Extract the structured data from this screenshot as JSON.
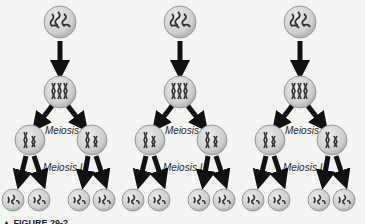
{
  "diagram": {
    "type": "meiosis-process",
    "columns": [
      {
        "id": "col-1",
        "cx": 60,
        "label_meiosis_1": "Meiosis I",
        "label_meiosis_2": "Meiosis II"
      },
      {
        "id": "col-2",
        "cx": 180,
        "label_meiosis_1": "Meiosis I",
        "label_meiosis_2": "Meiosis II"
      },
      {
        "id": "col-3",
        "cx": 300,
        "label_meiosis_1": "Meiosis I",
        "label_meiosis_2": "Meiosis II"
      }
    ],
    "stages": [
      "parent-cell",
      "replicated-chromosomes",
      "meiosis-i-daughters",
      "meiosis-ii-gametes"
    ],
    "caption": "▲ FIGURE 29-2"
  },
  "colors": {
    "background": "#f4f4f2",
    "cell_fill": "#c9c9c9",
    "cell_stroke": "#9a9a9a",
    "arrow": "#111111",
    "chromosome": "#2a2a2a"
  }
}
